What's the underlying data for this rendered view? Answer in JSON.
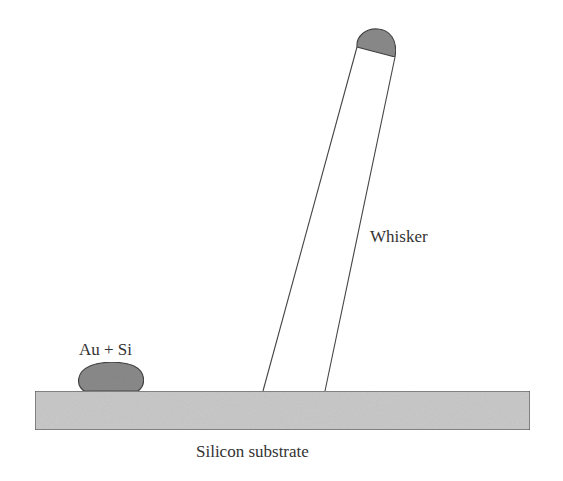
{
  "diagram": {
    "labels": {
      "whisker": "Whisker",
      "droplet": "Au + Si",
      "substrate": "Silicon substrate"
    },
    "colors": {
      "background": "#ffffff",
      "substrate_fill": "#c9c9c9",
      "substrate_stroke": "#555555",
      "droplet_fill": "#8a8a8a",
      "droplet_stroke": "#444444",
      "whisker_fill": "#ffffff",
      "whisker_stroke": "#444444",
      "cap_fill": "#8a8a8a",
      "text": "#333333"
    },
    "elements": [
      {
        "name": "silicon-substrate",
        "shape": "rectangle",
        "x": 35,
        "y": 391,
        "width": 495,
        "height": 39
      },
      {
        "name": "au-si-droplet",
        "shape": "ellipse",
        "cx": 110,
        "cy": 378,
        "rx": 32,
        "ry": 15
      },
      {
        "name": "whisker",
        "shape": "tilted-column",
        "base_left": [
          263,
          391
        ],
        "base_right": [
          325,
          391
        ],
        "top_left": [
          357,
          47
        ],
        "top_right": [
          395,
          57
        ]
      },
      {
        "name": "whisker-tip-cap",
        "shape": "dome",
        "top": [
          378,
          29
        ]
      }
    ]
  }
}
